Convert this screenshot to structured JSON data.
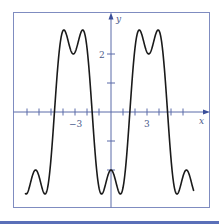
{
  "chart_data": {
    "type": "line",
    "title": "",
    "xlabel": "x",
    "ylabel": "y",
    "function": "y = -3(cos x - cos(3x)/3)",
    "xlim": [
      -7.2,
      8.1
    ],
    "ylim": [
      -3.3,
      3.45
    ],
    "x_domain": [
      -7.15,
      6.9
    ],
    "x_ticks": [
      -7,
      -6,
      -5,
      -4,
      -3,
      -2,
      -1,
      1,
      2,
      3,
      4,
      5,
      6
    ],
    "x_tick_labels": [
      {
        "value": -3,
        "label": "−3"
      },
      {
        "value": 3,
        "label": "3"
      }
    ],
    "y_ticks": [
      -2,
      -1,
      1,
      2
    ],
    "y_tick_labels": [
      {
        "value": 2,
        "label": "2"
      }
    ],
    "grid": false,
    "legend": null,
    "series": [
      {
        "name": "f(x)",
        "color": "#1a1a1a",
        "key_points": [
          {
            "x": -6.283,
            "y": -2.0,
            "note": "local max (lower)"
          },
          {
            "x": -4.712,
            "y": 0.0,
            "note": "zero crossing"
          },
          {
            "x": -3.927,
            "y": 2.83,
            "note": "peak"
          },
          {
            "x": -3.142,
            "y": 2.0,
            "note": "dip"
          },
          {
            "x": -2.356,
            "y": 2.83,
            "note": "peak"
          },
          {
            "x": -1.571,
            "y": 0.0,
            "note": "zero crossing"
          },
          {
            "x": -0.785,
            "y": -2.83,
            "note": "min"
          },
          {
            "x": 0.0,
            "y": -2.0,
            "note": "local max (lower)"
          },
          {
            "x": 0.785,
            "y": -2.83,
            "note": "min"
          },
          {
            "x": 1.571,
            "y": 0.0,
            "note": "zero crossing"
          },
          {
            "x": 2.356,
            "y": 2.83,
            "note": "peak"
          },
          {
            "x": 3.142,
            "y": 2.0,
            "note": "dip"
          },
          {
            "x": 3.927,
            "y": 2.83,
            "note": "peak"
          },
          {
            "x": 4.712,
            "y": 0.0,
            "note": "zero crossing"
          },
          {
            "x": 5.498,
            "y": -2.83,
            "note": "min"
          },
          {
            "x": 6.283,
            "y": -2.0,
            "note": "local max (lower)"
          }
        ]
      }
    ]
  },
  "axes": {
    "x_label": "x",
    "y_label": "y",
    "tick_label_neg3": "−3",
    "tick_label_3": "3",
    "tick_label_2": "2"
  },
  "colors": {
    "axis": "#5a6aa8",
    "frame": "#7f8cc0",
    "curve": "#1a1a1a",
    "band": "#5a6fb8"
  }
}
